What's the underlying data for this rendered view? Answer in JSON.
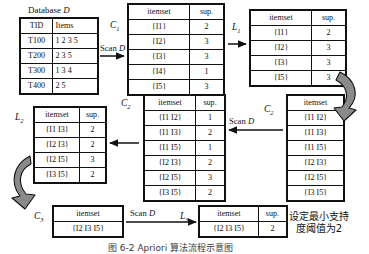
{
  "figure": {
    "caption": "图 6-2   Apriori 算法流程示意图",
    "note": "设定最小支持\n度阈值为2",
    "note_line1": "设定最小支持",
    "note_line2": "度阈值为2",
    "scan_label": "Scan D",
    "scan_word": "Scan",
    "scan_italic": "D"
  },
  "database": {
    "title_text": "Database",
    "title_italic": "D",
    "headers": [
      "TID",
      "Items"
    ],
    "rows": [
      {
        "tid": "T100",
        "items": "1 2 3 5"
      },
      {
        "tid": "T200",
        "items": "2 3 5"
      },
      {
        "tid": "T300",
        "items": "1 3 4"
      },
      {
        "tid": "T400",
        "items": "2 5"
      }
    ]
  },
  "c1": {
    "label": "C",
    "sub": "1",
    "headers": [
      "itemset",
      "sup."
    ],
    "rows": [
      {
        "itemset": "{I1}",
        "sup": "2"
      },
      {
        "itemset": "{I2}",
        "sup": "3"
      },
      {
        "itemset": "{I3}",
        "sup": "3"
      },
      {
        "itemset": "{I4}",
        "sup": "1"
      },
      {
        "itemset": "{I5}",
        "sup": "3"
      }
    ]
  },
  "l1": {
    "label": "L",
    "sub": "1",
    "headers": [
      "itemset",
      "sup."
    ],
    "rows": [
      {
        "itemset": "{I1}",
        "sup": "2"
      },
      {
        "itemset": "{I2}",
        "sup": "3"
      },
      {
        "itemset": "{I3}",
        "sup": "3"
      },
      {
        "itemset": "{I5}",
        "sup": "3"
      }
    ]
  },
  "c2_right": {
    "label": "C",
    "sub": "2",
    "headers": [
      "itemset"
    ],
    "rows": [
      {
        "itemset": "{I1 I2}"
      },
      {
        "itemset": "{I1 I3}"
      },
      {
        "itemset": "{I1 I5}"
      },
      {
        "itemset": "{I2 I3}"
      },
      {
        "itemset": "{I2 I5}"
      },
      {
        "itemset": "{I3 I5}"
      }
    ]
  },
  "c2_mid": {
    "label": "C",
    "sub": "2",
    "headers": [
      "itemset",
      "sup."
    ],
    "rows": [
      {
        "itemset": "{I1 I2}",
        "sup": "1"
      },
      {
        "itemset": "{I1 I3}",
        "sup": "2"
      },
      {
        "itemset": "{I1 I5}",
        "sup": "1"
      },
      {
        "itemset": "{I2 I3}",
        "sup": "2"
      },
      {
        "itemset": "{I2 I5}",
        "sup": "3"
      },
      {
        "itemset": "{I3 I5}",
        "sup": "2"
      }
    ]
  },
  "l2": {
    "label": "L",
    "sub": "2",
    "headers": [
      "itemset",
      "sup."
    ],
    "rows": [
      {
        "itemset": "{I1 I3}",
        "sup": "2"
      },
      {
        "itemset": "{I2 I3}",
        "sup": "2"
      },
      {
        "itemset": "{I2 I5}",
        "sup": "3"
      },
      {
        "itemset": "{I3 I5}",
        "sup": "2"
      }
    ]
  },
  "c3": {
    "label": "C",
    "sub": "3",
    "headers": [
      "itemset"
    ],
    "rows": [
      {
        "itemset": "{I2 I3 I5}"
      }
    ]
  },
  "l3": {
    "label": "L",
    "sub": "3",
    "headers": [
      "itemset",
      "sup."
    ],
    "rows": [
      {
        "itemset": "{I2 I3 I5}",
        "sup": "2"
      }
    ]
  },
  "colors": {
    "line": "#111111",
    "curve_fill": "#8a8a8a",
    "background": "#ffffff"
  }
}
